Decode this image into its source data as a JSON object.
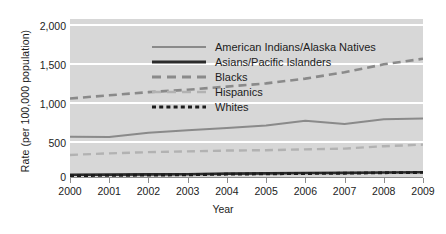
{
  "chart_data": {
    "type": "line",
    "title": "",
    "xlabel": "Year",
    "ylabel": "Rate (per 100,000 population)",
    "x": [
      2000,
      2001,
      2002,
      2003,
      2004,
      2005,
      2006,
      2007,
      2008,
      2009
    ],
    "xtick_labels": [
      "2000",
      "2001",
      "2002",
      "2003",
      "2004",
      "2005",
      "2006",
      "2007",
      "2008",
      "2009"
    ],
    "ytick_labels": [
      "0",
      "500",
      "1,000",
      "1,500",
      "2,000"
    ],
    "ytick_values": [
      0,
      500,
      1000,
      1500,
      2000
    ],
    "ylim": [
      0,
      2000
    ],
    "xlim": [
      2000,
      2009
    ],
    "grid": "horizontal",
    "legend_position": "inside-top-left",
    "plot_background": "#d7d7d7",
    "gridline_color": "#ffffff",
    "series": [
      {
        "name": "American Indians/Alaska Natives",
        "style": "solid",
        "color": "#8a8a8a",
        "width": 2.0,
        "values": [
          520,
          515,
          570,
          600,
          630,
          660,
          720,
          680,
          740,
          750
        ]
      },
      {
        "name": "Asians/Pacific Islanders",
        "style": "solid",
        "color": "#2b2b2b",
        "width": 2.6,
        "values": [
          40,
          42,
          45,
          48,
          55,
          58,
          62,
          65,
          70,
          72
        ]
      },
      {
        "name": "Blacks",
        "style": "dashed",
        "color": "#8a8a8a",
        "width": 2.6,
        "values": [
          1000,
          1040,
          1080,
          1110,
          1150,
          1190,
          1250,
          1330,
          1430,
          1500
        ]
      },
      {
        "name": "Hispanics",
        "style": "dashed",
        "color": "#b2b2b2",
        "width": 2.4,
        "values": [
          290,
          310,
          325,
          335,
          345,
          350,
          360,
          370,
          400,
          420
        ]
      },
      {
        "name": "Whites",
        "style": "dotted",
        "color": "#1c1c1c",
        "width": 2.8,
        "values": [
          30,
          33,
          36,
          40,
          48,
          52,
          56,
          60,
          66,
          70
        ]
      }
    ]
  }
}
